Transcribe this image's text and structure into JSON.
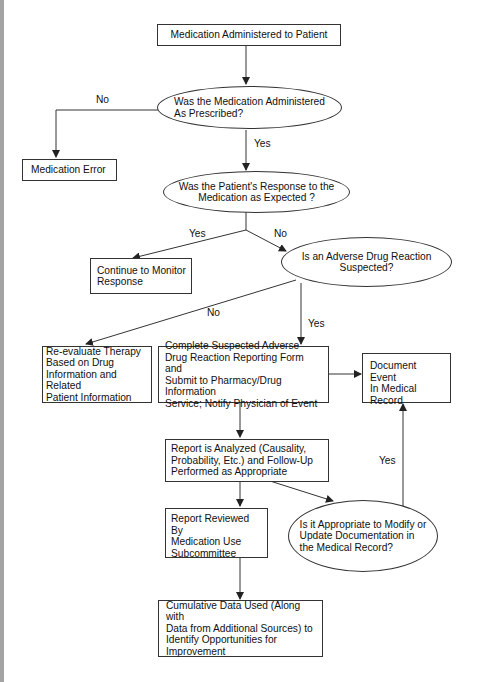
{
  "title": "",
  "colors": {
    "line": "#333333",
    "text": "#111111",
    "background": "#ffffff",
    "left_bar": "#a3a3a3"
  },
  "nodes": {
    "start": {
      "type": "process",
      "text": "Medication Administered to Patient"
    },
    "q_as_prescribed": {
      "type": "decision",
      "text": "Was the Medication Administered\nAs Prescribed?"
    },
    "medication_error": {
      "type": "process",
      "text": "Medication Error"
    },
    "q_response_expected": {
      "type": "decision",
      "text": "Was the Patient's Response to the\nMedication as Expected ?"
    },
    "continue_monitor": {
      "type": "process",
      "text": "Continue to Monitor\nResponse"
    },
    "q_adr_suspected": {
      "type": "decision",
      "text": "Is an Adverse Drug Reaction\nSuspected?"
    },
    "reevaluate_therapy": {
      "type": "process",
      "text": "Re-evaluate Therapy\nBased on Drug\nInformation and Related\nPatient Information"
    },
    "complete_report": {
      "type": "process",
      "text": "Complete Suspected Adverse\nDrug Reaction Reporting Form and\nSubmit to Pharmacy/Drug Information\nService; Notify Physician of Event"
    },
    "document_event": {
      "type": "process",
      "text": "Document Event\nIn Medical\nRecord"
    },
    "report_analyzed": {
      "type": "process",
      "text": "Report is Analyzed (Causality,\nProbability, Etc.) and Follow-Up\nPerformed as Appropriate"
    },
    "report_reviewed": {
      "type": "process",
      "text": "Report Reviewed By\nMedication Use\nSubcommittee"
    },
    "q_modify_documentation": {
      "type": "decision",
      "text": "Is it Appropriate to Modify or\nUpdate Documentation in\nthe Medical Record?"
    },
    "cumulative_data": {
      "type": "process",
      "text": "Cumulative Data Used (Along with\nData from Additional Sources) to\nIdentify Opportunities for\nImprovement"
    }
  },
  "edge_labels": {
    "as_prescribed_no": "No",
    "as_prescribed_yes": "Yes",
    "response_yes": "Yes",
    "response_no": "No",
    "adr_no": "No",
    "adr_yes": "Yes",
    "modify_yes": "Yes"
  },
  "edges": [
    {
      "from": "start",
      "to": "q_as_prescribed",
      "label": ""
    },
    {
      "from": "q_as_prescribed",
      "to": "medication_error",
      "label": "No"
    },
    {
      "from": "q_as_prescribed",
      "to": "q_response_expected",
      "label": "Yes"
    },
    {
      "from": "q_response_expected",
      "to": "continue_monitor",
      "label": "Yes"
    },
    {
      "from": "q_response_expected",
      "to": "q_adr_suspected",
      "label": "No"
    },
    {
      "from": "q_adr_suspected",
      "to": "reevaluate_therapy",
      "label": "No"
    },
    {
      "from": "q_adr_suspected",
      "to": "complete_report",
      "label": "Yes"
    },
    {
      "from": "complete_report",
      "to": "document_event",
      "label": ""
    },
    {
      "from": "complete_report",
      "to": "report_analyzed",
      "label": ""
    },
    {
      "from": "report_analyzed",
      "to": "report_reviewed",
      "label": ""
    },
    {
      "from": "report_analyzed",
      "to": "q_modify_documentation",
      "label": ""
    },
    {
      "from": "q_modify_documentation",
      "to": "document_event",
      "label": "Yes"
    },
    {
      "from": "report_reviewed",
      "to": "cumulative_data",
      "label": ""
    }
  ]
}
